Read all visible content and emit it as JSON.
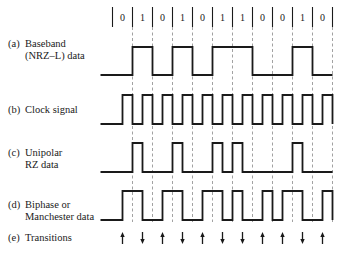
{
  "diagram": {
    "bits": [
      "0",
      "1",
      "0",
      "1",
      "0",
      "1",
      "1",
      "0",
      "0",
      "1",
      "0"
    ],
    "geometry": {
      "x_start": 112.5,
      "cell_width": 20,
      "bit_row_y": 17,
      "bar_top": 7,
      "bar_bottom": 27,
      "dash_top": 27,
      "dash_bottom": 222
    },
    "rows": [
      {
        "id": "a",
        "tag": "(a)",
        "line1": "Baseband",
        "line2": "(NRZ–L) data",
        "label_y": 38,
        "high_y": 47,
        "low_y": 75,
        "encoding": "nrz-l"
      },
      {
        "id": "b",
        "tag": "(b)",
        "line1": "Clock signal",
        "line2": "",
        "label_y": 104,
        "high_y": 95,
        "low_y": 124,
        "encoding": "clock"
      },
      {
        "id": "c",
        "tag": "(c)",
        "line1": "Unipolar",
        "line2": "RZ data",
        "label_y": 147,
        "high_y": 143,
        "low_y": 172,
        "encoding": "unipolar-rz"
      },
      {
        "id": "d",
        "tag": "(d)",
        "line1": "Biphase or",
        "line2": "Manchester data",
        "label_y": 199,
        "high_y": 191,
        "low_y": 220,
        "encoding": "manchester"
      },
      {
        "id": "e",
        "tag": "(e)",
        "line1": "Transitions",
        "line2": "",
        "label_y": 232,
        "encoding": "transitions"
      }
    ],
    "transitions": [
      "up",
      "down",
      "up",
      "down",
      "up",
      "down",
      "down",
      "up",
      "up",
      "down",
      "up"
    ],
    "transition_arrow_y": [
      232,
      244
    ],
    "colors": {
      "ink": "#1a1a1a",
      "dash": "#8a8a8a"
    }
  }
}
